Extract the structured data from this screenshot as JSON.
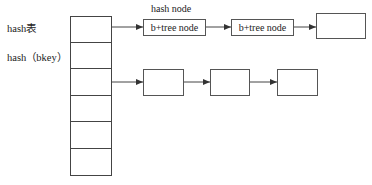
{
  "labels": {
    "hash_table": "hash表",
    "hash_key": "hash（bkey）",
    "hash_node": "hash node"
  },
  "table": {
    "rows": 6
  },
  "chain1": {
    "nodes": [
      {
        "label": "b+tree node"
      },
      {
        "label": "b+tree node"
      },
      {
        "label": ""
      }
    ]
  },
  "chain2": {
    "nodes": [
      {
        "label": ""
      },
      {
        "label": ""
      },
      {
        "label": ""
      }
    ]
  },
  "colors": {
    "line": "#444444",
    "background": "#ffffff"
  }
}
